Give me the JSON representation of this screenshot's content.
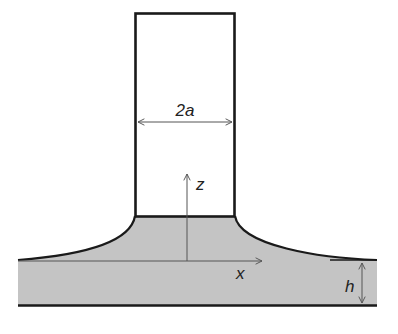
{
  "diagram": {
    "labels": {
      "width": "2a",
      "z_axis": "z",
      "x_axis": "x",
      "film_thickness": "h"
    },
    "colors": {
      "liquid_fill": "#c4c4c4",
      "outline": "#1a1a1a",
      "axis": "#555555",
      "background": "#ffffff"
    }
  }
}
